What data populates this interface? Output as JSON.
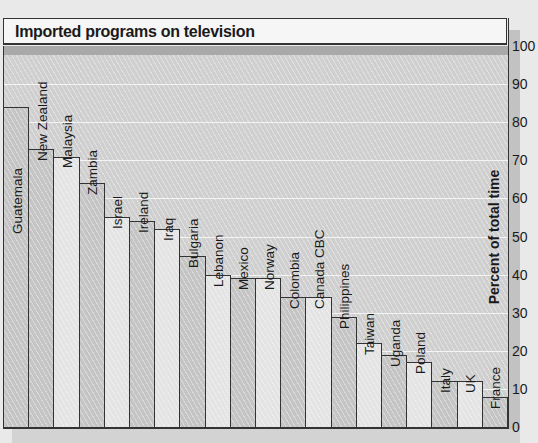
{
  "chart_data": {
    "type": "bar",
    "title": "Imported programs on television",
    "xlabel": "",
    "ylabel": "Percent of total time",
    "ylim": [
      0,
      100
    ],
    "yticks": [
      0,
      10,
      20,
      30,
      40,
      50,
      60,
      70,
      80,
      90,
      100
    ],
    "grid": true,
    "legend": null,
    "categories": [
      "Guatemala",
      "New Zealand",
      "Malaysia",
      "Zambia",
      "Israel",
      "Ireland",
      "Iraq",
      "Bulgaria",
      "Lebanon",
      "Mexico",
      "Norway",
      "Colombia",
      "Canada CBC",
      "Philippines",
      "Taiwan",
      "Uganda",
      "Poland",
      "Italy",
      "UK",
      "France"
    ],
    "values": [
      84,
      73,
      71,
      64,
      55,
      54,
      52,
      45,
      40,
      39,
      39,
      34,
      34,
      29,
      22,
      19,
      17,
      12,
      12,
      8
    ]
  },
  "colors": {
    "background": "#e9e9e9",
    "plot": "#cfcfcf",
    "bar_light": "#e4e4e4",
    "bar_dark": "#c4c4c4",
    "outline": "#333333"
  }
}
